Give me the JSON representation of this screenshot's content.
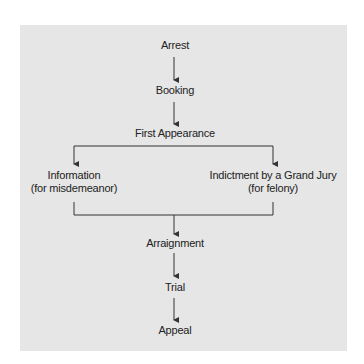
{
  "diagram": {
    "background_color": "#e6e6e6",
    "line_color": "#333333",
    "text_color": "#222222",
    "nodes": {
      "arrest": {
        "label": "Arrest"
      },
      "booking": {
        "label": "Booking"
      },
      "first_appearance": {
        "label": "First Appearance"
      },
      "information": {
        "line1": "Information",
        "line2": "(for misdemeanor)"
      },
      "indictment": {
        "line1": "Indictment by a Grand Jury",
        "line2": "(for felony)"
      },
      "arraignment": {
        "label": "Arraignment"
      },
      "trial": {
        "label": "Trial"
      },
      "appeal": {
        "label": "Appeal"
      }
    },
    "edges": [
      {
        "from": "Arrest",
        "to": "Booking"
      },
      {
        "from": "Booking",
        "to": "First Appearance"
      },
      {
        "from": "First Appearance",
        "to": "Information (for misdemeanor)"
      },
      {
        "from": "First Appearance",
        "to": "Indictment by a Grand Jury (for felony)"
      },
      {
        "from": "Information (for misdemeanor)",
        "to": "Arraignment"
      },
      {
        "from": "Indictment by a Grand Jury (for felony)",
        "to": "Arraignment"
      },
      {
        "from": "Arraignment",
        "to": "Trial"
      },
      {
        "from": "Trial",
        "to": "Appeal"
      }
    ]
  }
}
